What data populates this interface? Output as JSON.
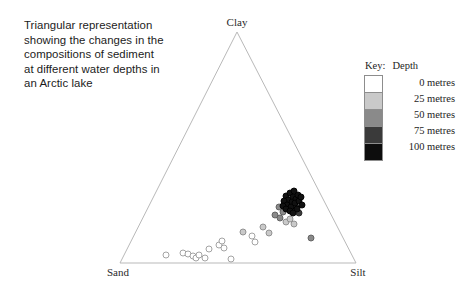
{
  "caption": {
    "text": "Triangular representation\nshowing the changes in the\ncompositions of sediment\nat different water depths in\nan Arctic lake"
  },
  "legend": {
    "key_word": "Key:",
    "title": "Depth",
    "entries": [
      {
        "label": "0 metres",
        "depth": 0,
        "color": "#ffffff"
      },
      {
        "label": "25 metres",
        "depth": 25,
        "color": "#c9c9c9"
      },
      {
        "label": "50 metres",
        "depth": 50,
        "color": "#8a8a8a"
      },
      {
        "label": "75 metres",
        "depth": 75,
        "color": "#3a3a3a"
      },
      {
        "label": "100 metres",
        "depth": 100,
        "color": "#0d0d0d"
      }
    ]
  },
  "chart_data": {
    "type": "scatter",
    "title": "Triangular representation showing the changes in the compositions of sediment at different water depths in an Arctic lake",
    "xlabel": "",
    "ylabel": "",
    "ternary": true,
    "grid": false,
    "legend_position": "right",
    "vertices": {
      "top": "Clay",
      "bottom_left": "Sand",
      "bottom_right": "Silt"
    },
    "geometry": {
      "apex_x": 237,
      "apex_y": 32,
      "left_x": 120,
      "left_y": 263,
      "right_x": 356,
      "right_y": 263
    },
    "series": [
      {
        "name": "0 metres",
        "depth": 0,
        "color": "#ffffff",
        "stroke": "#9a9a9a",
        "points": [
          {
            "px": 166,
            "py": 255
          },
          {
            "px": 183,
            "py": 253
          },
          {
            "px": 188,
            "py": 254
          },
          {
            "px": 193,
            "py": 256
          },
          {
            "px": 196,
            "py": 258
          },
          {
            "px": 199,
            "py": 255
          },
          {
            "px": 205,
            "py": 258
          },
          {
            "px": 209,
            "py": 249
          },
          {
            "px": 231,
            "py": 259
          },
          {
            "px": 219,
            "py": 245
          },
          {
            "px": 222,
            "py": 241
          },
          {
            "px": 224,
            "py": 248
          },
          {
            "px": 252,
            "py": 236
          },
          {
            "px": 255,
            "py": 242
          }
        ]
      },
      {
        "name": "25 metres",
        "depth": 25,
        "color": "#c9c9c9",
        "stroke": "#8a8a8a",
        "points": [
          {
            "px": 243,
            "py": 232
          },
          {
            "px": 263,
            "py": 227
          },
          {
            "px": 269,
            "py": 233
          },
          {
            "px": 286,
            "py": 222
          },
          {
            "px": 290,
            "py": 219
          },
          {
            "px": 294,
            "py": 224
          }
        ]
      },
      {
        "name": "50 metres",
        "depth": 50,
        "color": "#8a8a8a",
        "stroke": "#5c5c5c",
        "points": [
          {
            "px": 275,
            "py": 215
          },
          {
            "px": 280,
            "py": 218
          },
          {
            "px": 283,
            "py": 212
          },
          {
            "px": 279,
            "py": 207
          },
          {
            "px": 311,
            "py": 238
          }
        ]
      },
      {
        "name": "75 metres",
        "depth": 75,
        "color": "#3a3a3a",
        "stroke": "#262626",
        "points": [
          {
            "px": 292,
            "py": 211
          },
          {
            "px": 296,
            "py": 207
          },
          {
            "px": 299,
            "py": 213
          },
          {
            "px": 289,
            "py": 204
          }
        ]
      },
      {
        "name": "100 metres",
        "depth": 100,
        "color": "#111111",
        "stroke": "#000000",
        "points": [
          {
            "px": 286,
            "py": 196
          },
          {
            "px": 290,
            "py": 193
          },
          {
            "px": 293,
            "py": 197
          },
          {
            "px": 288,
            "py": 200
          },
          {
            "px": 292,
            "py": 202
          },
          {
            "px": 296,
            "py": 199
          },
          {
            "px": 284,
            "py": 201
          },
          {
            "px": 287,
            "py": 205
          },
          {
            "px": 291,
            "py": 207
          },
          {
            "px": 295,
            "py": 203
          },
          {
            "px": 299,
            "py": 201
          },
          {
            "px": 302,
            "py": 205
          },
          {
            "px": 283,
            "py": 206
          },
          {
            "px": 294,
            "py": 191
          },
          {
            "px": 298,
            "py": 195
          },
          {
            "px": 286,
            "py": 209
          },
          {
            "px": 290,
            "py": 211
          },
          {
            "px": 301,
            "py": 197
          },
          {
            "px": 297,
            "py": 209
          },
          {
            "px": 293,
            "py": 213
          }
        ]
      }
    ]
  }
}
